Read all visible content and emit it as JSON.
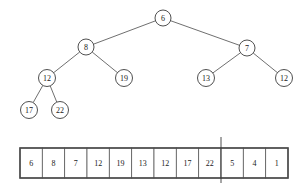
{
  "figure": {
    "stroke_color": "#3c3c3c",
    "node_fill": "#ffffff",
    "text_color": "#1a1a1a"
  },
  "chart_data": {
    "type": "diagram",
    "tree": {
      "nodes": [
        {
          "id": "n0",
          "label": "6",
          "x": 163,
          "y": 18,
          "r": 8,
          "level": 0
        },
        {
          "id": "n1",
          "label": "8",
          "x": 86,
          "y": 47,
          "r": 8,
          "level": 1
        },
        {
          "id": "n2",
          "label": "7",
          "x": 247,
          "y": 48,
          "r": 8,
          "level": 1
        },
        {
          "id": "n3",
          "label": "12",
          "x": 47,
          "y": 78,
          "r": 8.5,
          "level": 2
        },
        {
          "id": "n4",
          "label": "19",
          "x": 124,
          "y": 78,
          "r": 8.5,
          "level": 2
        },
        {
          "id": "n5",
          "label": "13",
          "x": 206,
          "y": 78,
          "r": 8.5,
          "level": 2
        },
        {
          "id": "n6",
          "label": "12",
          "x": 284,
          "y": 78,
          "r": 8.5,
          "level": 2
        },
        {
          "id": "n7",
          "label": "17",
          "x": 29,
          "y": 110,
          "r": 8.5,
          "level": 3
        },
        {
          "id": "n8",
          "label": "22",
          "x": 60,
          "y": 110,
          "r": 8.5,
          "level": 3
        }
      ],
      "edges": [
        {
          "from": "n0",
          "to": "n1"
        },
        {
          "from": "n0",
          "to": "n2"
        },
        {
          "from": "n1",
          "to": "n3"
        },
        {
          "from": "n1",
          "to": "n4"
        },
        {
          "from": "n2",
          "to": "n5"
        },
        {
          "from": "n2",
          "to": "n6"
        },
        {
          "from": "n3",
          "to": "n7"
        },
        {
          "from": "n3",
          "to": "n8"
        }
      ]
    },
    "array": {
      "cells": [
        "6",
        "8",
        "7",
        "12",
        "19",
        "13",
        "12",
        "17",
        "22",
        "5",
        "4",
        "1"
      ],
      "heap_size": 9,
      "divider_after_index": 9,
      "box": {
        "x": 20,
        "y": 148,
        "width": 268,
        "height": 30
      },
      "divider": {
        "x": 221,
        "y1": 137,
        "y2": 183
      }
    }
  }
}
